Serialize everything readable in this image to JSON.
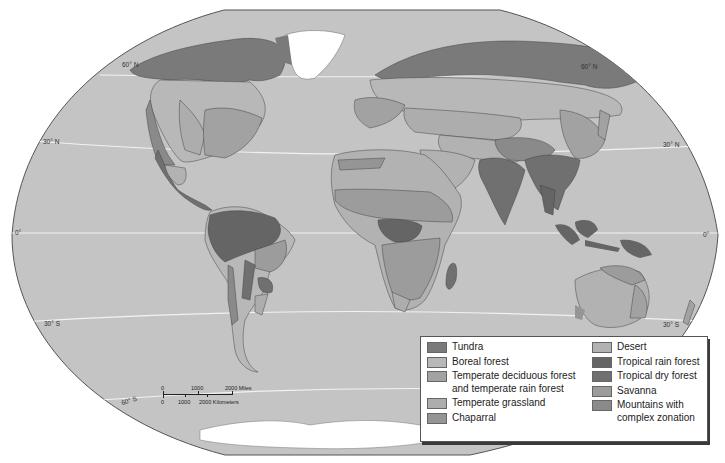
{
  "figure": {
    "type": "world biome map",
    "clipped_title_visible": false
  },
  "colors": {
    "ocean": "#c4c4c4",
    "map_border": "#555555",
    "latitude_line": "#f2f2f2",
    "ice": "#ffffff",
    "tundra": "#7a7a7a",
    "boreal_forest": "#b8b8b8",
    "temperate_deciduous": "#a2a2a2",
    "temperate_grassland": "#adadad",
    "chaparral": "#959595",
    "desert": "#b2b2b2",
    "tropical_rain_forest": "#656565",
    "tropical_dry_forest": "#707070",
    "savanna": "#9c9c9c",
    "mountains": "#8a8a8a"
  },
  "latitude_labels": {
    "n60_left": "60° N",
    "n60_right": "60° N",
    "n30_left": "30° N",
    "n30_right": "30° N",
    "eq_left": "0°",
    "eq_right": "0°",
    "s30_left": "30° S",
    "s30_right": "30° S",
    "s60_left": "60° S"
  },
  "scale_bar": {
    "miles_labels": [
      "0",
      "1000",
      "2000 Miles"
    ],
    "km_labels": [
      "0",
      "1000",
      "2000 Kilometers"
    ]
  },
  "legend": {
    "left": [
      {
        "label": "Tundra",
        "color": "#7a7a7a"
      },
      {
        "label": "Boreal forest",
        "color": "#b8b8b8"
      },
      {
        "label": "Temperate deciduous forest\nand temperate rain forest",
        "line1": "Temperate deciduous forest",
        "line2": "and temperate rain forest",
        "color": "#a2a2a2"
      },
      {
        "label": "Temperate grassland",
        "color": "#adadad"
      },
      {
        "label": "Chaparral",
        "color": "#959595"
      }
    ],
    "right": [
      {
        "label": "Desert",
        "color": "#b2b2b2"
      },
      {
        "label": "Tropical rain forest",
        "color": "#656565"
      },
      {
        "label": "Tropical dry forest",
        "color": "#707070"
      },
      {
        "label": "Savanna",
        "color": "#9c9c9c"
      },
      {
        "label": "Mountains with complex zonation",
        "line1": "Mountains with",
        "line2": "complex zonation",
        "color": "#8a8a8a"
      }
    ]
  }
}
